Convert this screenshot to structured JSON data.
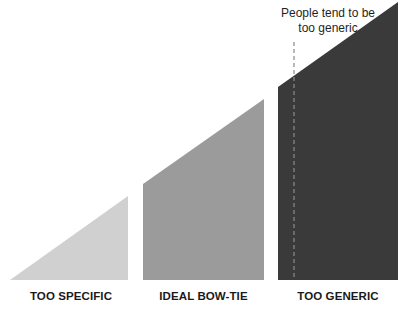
{
  "annotation": {
    "line1": "People tend to be",
    "line2": "too generic"
  },
  "shapes": [
    {
      "label": "TOO SPECIFIC",
      "color": "#d0d0d0"
    },
    {
      "label": "IDEAL BOW-TIE",
      "color": "#9b9b9b"
    },
    {
      "label": "TOO GENERIC",
      "color": "#3a3a3a"
    }
  ],
  "dashed_line_color": "#8a8a8a"
}
